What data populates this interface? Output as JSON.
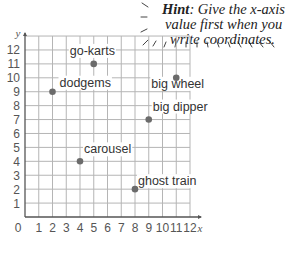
{
  "hint": {
    "bold": "Hint",
    "lines": [
      ": Give the x-axis",
      "value first when you",
      "write coordinates."
    ]
  },
  "chart_data": {
    "type": "scatter",
    "title": "",
    "xlabel": "x",
    "ylabel": "y",
    "xlim": [
      0,
      12
    ],
    "ylim": [
      0,
      13
    ],
    "grid": true,
    "x_ticks": [
      "0",
      "1",
      "2",
      "3",
      "4",
      "5",
      "6",
      "7",
      "8",
      "9",
      "10",
      "11",
      "12"
    ],
    "y_ticks": [
      "1",
      "2",
      "3",
      "4",
      "5",
      "6",
      "7",
      "8",
      "9",
      "10",
      "11",
      "12"
    ],
    "points": [
      {
        "label": "go-karts",
        "x": 5,
        "y": 11
      },
      {
        "label": "dodgems",
        "x": 2,
        "y": 9
      },
      {
        "label": "big wheel",
        "x": 11,
        "y": 10
      },
      {
        "label": "big dipper",
        "x": 9,
        "y": 7
      },
      {
        "label": "carousel",
        "x": 4,
        "y": 4
      },
      {
        "label": "ghost train",
        "x": 8,
        "y": 2
      }
    ],
    "point_color": "#6b6b6b",
    "grid_color": "#b5b5b5",
    "axis_color": "#555555"
  }
}
